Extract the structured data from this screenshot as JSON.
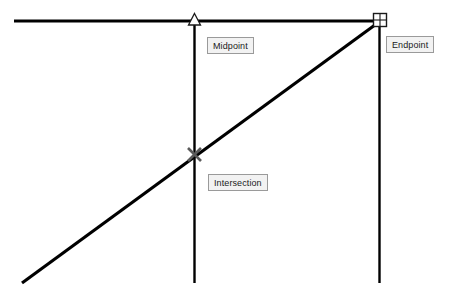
{
  "canvas": {
    "width": 451,
    "height": 300,
    "background_color": "#ffffff",
    "line_color": "#000000"
  },
  "geometry": {
    "horizontal_line": {
      "name": "top-horizontal-line",
      "x1": 14,
      "y1": 21,
      "x2": 380,
      "y2": 21,
      "width": 3
    },
    "left_vertical_line": {
      "name": "left-vertical-line",
      "x1": 194,
      "y1": 21,
      "x2": 194,
      "y2": 283,
      "width": 2
    },
    "right_vertical_line": {
      "name": "right-vertical-line",
      "x1": 379,
      "y1": 21,
      "x2": 379,
      "y2": 283,
      "width": 2
    },
    "diagonal_line": {
      "name": "diagonal-line",
      "x1": 22,
      "y1": 283,
      "x2": 379,
      "y2": 22,
      "width": 3
    }
  },
  "snap_markers": [
    {
      "id": "midpoint",
      "type": "triangle",
      "label": "Midpoint",
      "x": 194,
      "y": 21,
      "size": 11,
      "color": "#000000"
    },
    {
      "id": "endpoint",
      "type": "square",
      "label": "Endpoint",
      "x": 380,
      "y": 20,
      "size": 13,
      "color": "#000000"
    },
    {
      "id": "intersection",
      "type": "cross-x",
      "label": "Intersection",
      "x": 194,
      "y": 154,
      "size": 13,
      "color": "#555555"
    }
  ],
  "tooltips": {
    "midpoint": {
      "text": "Midpoint",
      "x": 207,
      "y": 37,
      "width": 51,
      "height": 17
    },
    "endpoint": {
      "text": "Endpoint",
      "x": 386,
      "y": 36,
      "width": 49,
      "height": 17
    },
    "intersection": {
      "text": "Intersection",
      "x": 208,
      "y": 174,
      "width": 60,
      "height": 17
    }
  },
  "style": {
    "tooltip_background": "#f2f2f2",
    "tooltip_border": "#9a9a9a",
    "tooltip_text_color": "#1a1a1a"
  }
}
